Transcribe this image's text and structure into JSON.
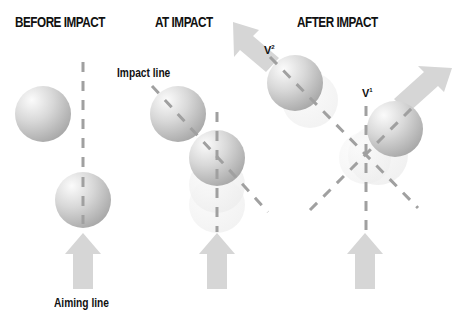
{
  "panels": {
    "before": {
      "title": "BEFORE IMPACT"
    },
    "at": {
      "title": "AT IMPACT"
    },
    "after": {
      "title": "AFTER IMPACT"
    }
  },
  "labels": {
    "impact_line": "Impact line",
    "aiming_line": "Aiming line",
    "v2": {
      "base": "V",
      "sup": "2"
    },
    "v1": {
      "base": "V",
      "sup": "1"
    }
  },
  "colors": {
    "ball_light": "#f4f4f4",
    "ball_dark": "#a8a8a8",
    "dash": "#a0a0a0",
    "arrow": "#d6d6d6",
    "ghost": "#efefef",
    "text": "#111111"
  }
}
